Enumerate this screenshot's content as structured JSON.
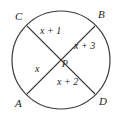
{
  "figure": {
    "stroke_color": "#3a3a3a",
    "text_color": "#1c1c1c",
    "background_color": "#ffffff"
  },
  "circle": {
    "center_x": 61,
    "center_y": 60,
    "radius": 49
  },
  "vertices": [
    {
      "id": "C",
      "label": "C",
      "x": 19,
      "y": 18,
      "circle_x": 27,
      "circle_y": 26
    },
    {
      "id": "B",
      "label": "B",
      "x": 100,
      "y": 14,
      "circle_x": 95,
      "circle_y": 26
    },
    {
      "id": "A",
      "label": "A",
      "x": 18,
      "y": 100,
      "circle_x": 27,
      "circle_y": 94
    },
    {
      "id": "D",
      "label": "D",
      "x": 102,
      "y": 98,
      "circle_x": 95,
      "circle_y": 94
    },
    {
      "id": "P",
      "label": "P",
      "x": 63,
      "y": 57,
      "circle_x": 61,
      "circle_y": 60
    }
  ],
  "segments": [
    {
      "id": "CP",
      "label": "x + 1",
      "x": 44,
      "y": 27
    },
    {
      "id": "PB",
      "label": "x + 3",
      "x": 76,
      "y": 40
    },
    {
      "id": "AP",
      "label": "x",
      "x": 36,
      "y": 65
    },
    {
      "id": "PD",
      "label": "x + 2",
      "x": 58,
      "y": 76
    }
  ],
  "chords": [
    {
      "id": "chord-CD",
      "from": "C",
      "to": "D"
    },
    {
      "id": "chord-AB",
      "from": "A",
      "to": "B"
    }
  ]
}
